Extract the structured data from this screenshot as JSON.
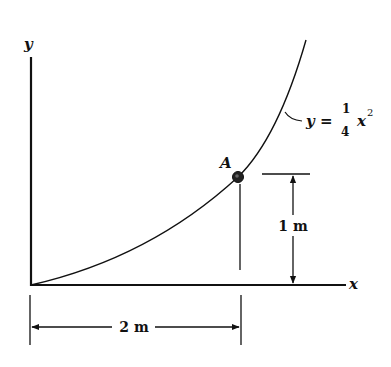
{
  "diagram": {
    "axes": {
      "x_label": "x",
      "y_label": "y"
    },
    "curve": {
      "equation_lhs": "y =",
      "coef_numerator": "1",
      "coef_denominator": "4",
      "var": "x",
      "exponent": "2"
    },
    "point": {
      "label": "A"
    },
    "dimensions": {
      "vertical": "1 m",
      "horizontal": "2 m"
    },
    "colors": {
      "ink": "#111111",
      "background": "#ffffff"
    }
  }
}
